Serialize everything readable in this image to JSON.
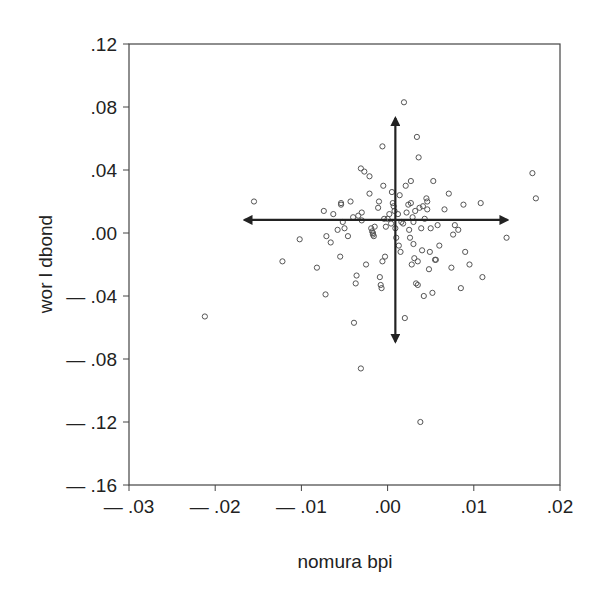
{
  "chart_data": {
    "type": "scatter",
    "title": "",
    "xlabel": "nomura bpi",
    "ylabel": "wor l dbond",
    "xlim": [
      -0.03,
      0.02
    ],
    "ylim": [
      -0.16,
      0.12
    ],
    "xticks": [
      -0.03,
      -0.02,
      -0.01,
      0.0,
      0.01,
      0.02
    ],
    "xtick_labels": [
      "— .03",
      "— .02",
      "— .01",
      ".00",
      ".01",
      ".02"
    ],
    "yticks": [
      0.12,
      0.08,
      0.04,
      0.0,
      -0.04,
      -0.08,
      -0.12,
      -0.16
    ],
    "ytick_labels": [
      ".12",
      ".08",
      ".04",
      ".00",
      "— .04",
      "— .08",
      "— .12",
      "— .16"
    ],
    "grid": false,
    "legend": null,
    "marker": "open-circle",
    "annotations": [
      {
        "type": "arrow",
        "direction": "up",
        "from": [
          0.0009,
          0.0
        ],
        "to": [
          0.0009,
          0.073
        ]
      },
      {
        "type": "arrow",
        "direction": "down",
        "from": [
          0.0009,
          0.0
        ],
        "to": [
          0.0009,
          -0.069
        ]
      },
      {
        "type": "arrow",
        "direction": "left",
        "from": [
          0.0,
          0.0083
        ],
        "to": [
          -0.0166,
          0.0083
        ]
      },
      {
        "type": "arrow",
        "direction": "right",
        "from": [
          0.0,
          0.0083
        ],
        "to": [
          0.0139,
          0.0083
        ]
      }
    ],
    "points": [
      [
        -0.0212,
        -0.053
      ],
      [
        -0.0155,
        0.02
      ],
      [
        -0.0122,
        -0.018
      ],
      [
        -0.0102,
        -0.004
      ],
      [
        -0.0082,
        -0.022
      ],
      [
        -0.0074,
        0.014
      ],
      [
        -0.0072,
        -0.039
      ],
      [
        -0.0071,
        -0.002
      ],
      [
        -0.0066,
        -0.006
      ],
      [
        -0.0063,
        0.012
      ],
      [
        -0.0058,
        0.002
      ],
      [
        -0.0055,
        -0.015
      ],
      [
        -0.0054,
        0.019
      ],
      [
        -0.0054,
        0.018
      ],
      [
        -0.0052,
        0.007
      ],
      [
        -0.005,
        0.003
      ],
      [
        -0.0046,
        -0.002
      ],
      [
        -0.0043,
        0.02
      ],
      [
        -0.004,
        0.01
      ],
      [
        -0.0039,
        -0.057
      ],
      [
        -0.0037,
        -0.032
      ],
      [
        -0.0036,
        -0.027
      ],
      [
        -0.0034,
        0.011
      ],
      [
        -0.0031,
        0.041
      ],
      [
        -0.0031,
        -0.086
      ],
      [
        -0.003,
        0.008
      ],
      [
        -0.003,
        0.013
      ],
      [
        -0.0027,
        0.039
      ],
      [
        -0.0025,
        -0.02
      ],
      [
        -0.0021,
        0.036
      ],
      [
        -0.0021,
        0.025
      ],
      [
        -0.0019,
        0.003
      ],
      [
        -0.0018,
        0.001
      ],
      [
        -0.0017,
        -0.001
      ],
      [
        -0.0017,
        0.0
      ],
      [
        -0.0016,
        -0.002
      ],
      [
        -0.0015,
        0.004
      ],
      [
        -0.0011,
        0.016
      ],
      [
        -0.001,
        0.02
      ],
      [
        -0.0009,
        -0.028
      ],
      [
        -0.0008,
        -0.033
      ],
      [
        -0.0007,
        -0.035
      ],
      [
        -0.0006,
        0.055
      ],
      [
        -0.0006,
        -0.018
      ],
      [
        -0.0005,
        0.03
      ],
      [
        -0.0004,
        0.009
      ],
      [
        -0.0003,
        -0.015
      ],
      [
        -0.0002,
        0.004
      ],
      [
        0.0,
        0.009
      ],
      [
        0.0002,
        0.012
      ],
      [
        0.0004,
        0.006
      ],
      [
        0.0005,
        0.026
      ],
      [
        0.0006,
        0.019
      ],
      [
        0.0007,
        0.017
      ],
      [
        0.0008,
        0.014
      ],
      [
        0.0009,
        0.003
      ],
      [
        0.001,
        -0.003
      ],
      [
        0.0012,
        0.012
      ],
      [
        0.0013,
        -0.008
      ],
      [
        0.0014,
        0.024
      ],
      [
        0.0015,
        -0.012
      ],
      [
        0.0016,
        0.007
      ],
      [
        0.0018,
        0.006
      ],
      [
        0.0019,
        0.083
      ],
      [
        0.002,
        -0.054
      ],
      [
        0.0021,
        0.03
      ],
      [
        0.0022,
        0.013
      ],
      [
        0.0024,
        0.018
      ],
      [
        0.0025,
        0.002
      ],
      [
        0.0026,
        -0.003
      ],
      [
        0.0027,
        0.033
      ],
      [
        0.0027,
        0.019
      ],
      [
        0.0028,
        -0.02
      ],
      [
        0.0029,
        0.01
      ],
      [
        0.003,
        0.007
      ],
      [
        0.003,
        -0.007
      ],
      [
        0.0031,
        -0.016
      ],
      [
        0.0032,
        0.014
      ],
      [
        0.0033,
        -0.032
      ],
      [
        0.0034,
        0.061
      ],
      [
        0.0035,
        -0.033
      ],
      [
        0.0035,
        -0.018
      ],
      [
        0.0036,
        0.048
      ],
      [
        0.0037,
        0.016
      ],
      [
        0.0038,
        -0.12
      ],
      [
        0.0039,
        0.003
      ],
      [
        0.004,
        -0.011
      ],
      [
        0.0041,
        0.017
      ],
      [
        0.0042,
        -0.04
      ],
      [
        0.0043,
        0.009
      ],
      [
        0.0045,
        0.022
      ],
      [
        0.0046,
        0.02
      ],
      [
        0.0046,
        0.015
      ],
      [
        0.0048,
        -0.023
      ],
      [
        0.0049,
        -0.012
      ],
      [
        0.005,
        0.003
      ],
      [
        0.0052,
        -0.038
      ],
      [
        0.0053,
        0.033
      ],
      [
        0.0055,
        -0.017
      ],
      [
        0.0056,
        -0.017
      ],
      [
        0.0058,
        0.005
      ],
      [
        0.006,
        -0.008
      ],
      [
        0.0066,
        0.015
      ],
      [
        0.0071,
        0.025
      ],
      [
        0.0074,
        -0.022
      ],
      [
        0.0076,
        -0.001
      ],
      [
        0.0078,
        0.005
      ],
      [
        0.0082,
        0.002
      ],
      [
        0.0085,
        -0.035
      ],
      [
        0.0088,
        0.018
      ],
      [
        0.009,
        -0.012
      ],
      [
        0.0095,
        -0.02
      ],
      [
        0.0108,
        0.019
      ],
      [
        0.011,
        -0.028
      ],
      [
        0.0138,
        -0.003
      ],
      [
        0.0168,
        0.038
      ],
      [
        0.0172,
        0.022
      ]
    ]
  }
}
